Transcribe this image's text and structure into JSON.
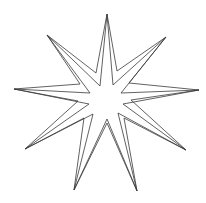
{
  "figure": {
    "width": 206,
    "height": 203,
    "background": "#ffffff",
    "shape": "nine-pointed-star",
    "stroke_color": "#3a3a3a",
    "stroke_width": 0.8,
    "outlines": [
      {
        "name": "outer-outline",
        "points": [
          [
            107,
            14
          ],
          [
            117,
            71
          ],
          [
            166,
            37
          ],
          [
            129,
            83
          ],
          [
            199,
            90
          ],
          [
            131,
            100
          ],
          [
            186,
            150
          ],
          [
            124,
            118
          ],
          [
            137,
            191
          ],
          [
            107,
            123
          ],
          [
            74,
            190
          ],
          [
            84,
            118
          ],
          [
            25,
            149
          ],
          [
            78,
            101
          ],
          [
            14,
            89
          ],
          [
            80,
            84
          ],
          [
            47,
            35
          ],
          [
            96,
            73
          ]
        ]
      },
      {
        "name": "inner-outline",
        "points": [
          [
            107,
            14
          ],
          [
            113,
            85
          ],
          [
            166,
            37
          ],
          [
            121,
            93
          ],
          [
            199,
            90
          ],
          [
            123,
            104
          ],
          [
            186,
            150
          ],
          [
            118,
            113
          ],
          [
            137,
            191
          ],
          [
            107,
            119
          ],
          [
            74,
            190
          ],
          [
            93,
            114
          ],
          [
            25,
            149
          ],
          [
            89,
            104
          ],
          [
            14,
            89
          ],
          [
            90,
            93
          ],
          [
            47,
            35
          ],
          [
            100,
            86
          ]
        ]
      }
    ]
  }
}
